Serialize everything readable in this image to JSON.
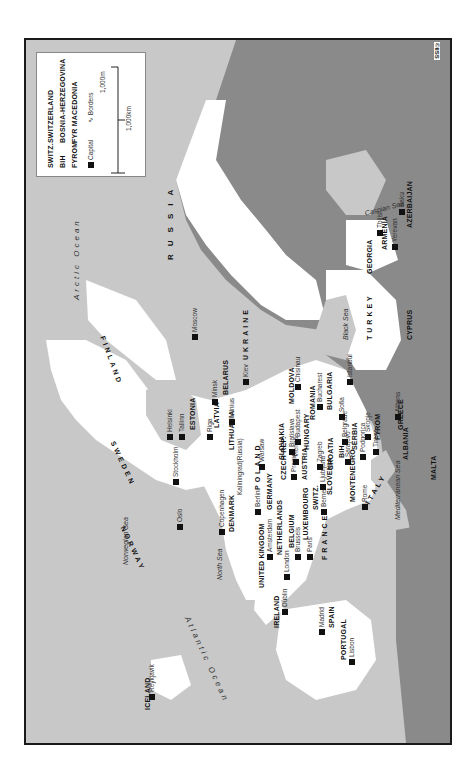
{
  "map": {
    "title": "Europe",
    "orientation": "rotated 90° counter-clockwise (north at left)",
    "colors": {
      "sea": "#c8c8c8",
      "land_featured": "#ffffff",
      "land_other": "#8a8a8a",
      "border": "#555555",
      "frame": "#1a1a1a"
    },
    "copyright": "©IISS"
  },
  "legend": {
    "abbreviations": [
      {
        "abbr": "SWITZ.",
        "full": "SWITZERLAND"
      },
      {
        "abbr": "BiH",
        "full": "BOSNIA-HERZEGOVINA"
      },
      {
        "abbr": "FYROM",
        "full": "FYR MACEDONIA"
      }
    ],
    "capital_label": "Capital",
    "borders_label": "Borders",
    "scale_miles": "1,000m",
    "scale_km": "1,000km"
  },
  "oceans": {
    "arctic": "Arctic Ocean",
    "atlantic": "Atlantic Ocean"
  },
  "seas": {
    "norwegian": "Norwegian Sea",
    "north": "North Sea",
    "mediterranean": "Mediterranean Sea",
    "black": "Black Sea",
    "caspian": "Caspian Sea"
  },
  "countries": {
    "iceland": "ICELAND",
    "ireland": "IRELAND",
    "uk": "UNITED KINGDOM",
    "portugal": "PORTUGAL",
    "spain": "SPAIN",
    "france": "FRANCE",
    "netherlands": "NETHERLANDS",
    "belgium": "BELGIUM",
    "luxembourg": "LUXEMBOURG",
    "germany": "GERMANY",
    "denmark": "DENMARK",
    "norway": "NORWAY",
    "sweden": "SWEDEN",
    "finland": "FINLAND",
    "estonia": "ESTONIA",
    "latvia": "LATVIA",
    "lithuania": "LITHUANIA",
    "belarus": "BELARUS",
    "poland": "POLAND",
    "czech": "CZECH REP.",
    "slovakia": "SLOVAKIA",
    "austria": "AUSTRIA",
    "switz": "SWITZ.",
    "slovenia": "SLOVENIA",
    "croatia": "CROATIA",
    "bih": "BiH",
    "serbia": "SERBIA",
    "montenegro": "MONTENEGRO",
    "albania": "ALBANIA",
    "fyrom": "FYROM",
    "greece": "GREECE",
    "italy": "ITALY",
    "malta": "MALTA",
    "hungary": "HUNGARY",
    "romania": "ROMANIA",
    "moldova": "MOLDOVA",
    "bulgaria": "BULGARIA",
    "ukraine": "UKRAINE",
    "russia": "RUSSIA",
    "turkey": "TURKEY",
    "cyprus": "CYPRUS",
    "georgia": "GEORGIA",
    "armenia": "ARMENIA",
    "azerbaijan": "AZERBAIJAN"
  },
  "cities": {
    "reykjavik": "Reykjavik",
    "dublin": "Dublin",
    "london": "London",
    "lisbon": "Lisbon",
    "madrid": "Madrid",
    "paris": "Paris",
    "brussels": "Brussels",
    "amsterdam": "Amsterdam",
    "berlin": "Berlin",
    "copenhagen": "Copenhagen",
    "oslo": "Oslo",
    "stockholm": "Stockholm",
    "helsinki": "Helsinki",
    "tallinn": "Tallinn",
    "riga": "Riga",
    "vilnius": "Vilnius",
    "kaliningrad": "Kaliningrad(Russia)",
    "minsk": "Minsk",
    "moscow": "Moscow",
    "warsaw": "Warsaw",
    "prague": "Prague",
    "vienna": "Vienna",
    "bratislava": "Bratislava",
    "budapest": "Budapest",
    "bern": "Berne",
    "ljubljana": "Ljubljana",
    "zagreb": "Zagreb",
    "sarajevo": "Sarajevo",
    "belgrade": "Belgrade",
    "podgorica": "Podgorica",
    "tirana": "Tirana",
    "skopje": "Skopje",
    "sofia": "Sofia",
    "athens": "Athens",
    "rome": "Rome",
    "bucharest": "Bucharest",
    "chisinau": "Chisinau",
    "kiev": "Kiev",
    "istanbul": "Istanbul",
    "tbilisi": "Tbilisi",
    "yerevan": "Yerevan",
    "baku": "Baku"
  }
}
